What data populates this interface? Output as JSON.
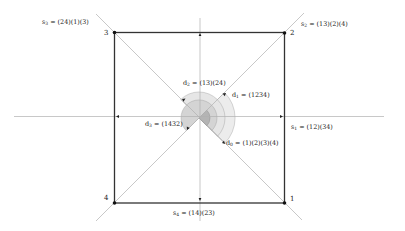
{
  "diagram": {
    "vertices": [
      {
        "id": "1",
        "label": "1",
        "x": 284,
        "y": 203
      },
      {
        "id": "2",
        "label": "2",
        "x": 284,
        "y": 33
      },
      {
        "id": "3",
        "label": "3",
        "x": 114,
        "y": 32
      },
      {
        "id": "4",
        "label": "4",
        "x": 114,
        "y": 203
      }
    ],
    "center": {
      "x": 199,
      "y": 118
    },
    "reflections": [
      {
        "name": "s1",
        "sym": "s",
        "sub": "1",
        "cycles": " = (12)(34)",
        "axis": "horizontal"
      },
      {
        "name": "s2",
        "sym": "s",
        "sub": "2",
        "cycles": " = (13)(2)(4)",
        "axis": "diagonal-3-1"
      },
      {
        "name": "s3",
        "sym": "s",
        "sub": "3",
        "cycles": " = (24)(1)(3)",
        "axis": "diagonal-4-2"
      },
      {
        "name": "s4",
        "sym": "s",
        "sub": "4",
        "cycles": " = (14)(23)",
        "axis": "vertical"
      }
    ],
    "rotations": [
      {
        "name": "d0",
        "sym": "d",
        "sub": "0",
        "cycles": " = (1)(2)(3)(4)",
        "angle_deg": 0
      },
      {
        "name": "d1",
        "sym": "d",
        "sub": "1",
        "cycles": " = (1234)",
        "angle_deg": 90
      },
      {
        "name": "d2",
        "sym": "d",
        "sub": "2",
        "cycles": " = (13)(24)",
        "angle_deg": 180
      },
      {
        "name": "d3",
        "sym": "d",
        "sub": "3",
        "cycles": " = (1432)",
        "angle_deg": 270
      }
    ],
    "colors": {
      "square": "#333333",
      "axes": "#b0b0b0",
      "arc_light": "#ececec",
      "arc_mid": "#d4d4d4",
      "arc_dark": "#b4b4b4",
      "text": "#222222"
    }
  }
}
